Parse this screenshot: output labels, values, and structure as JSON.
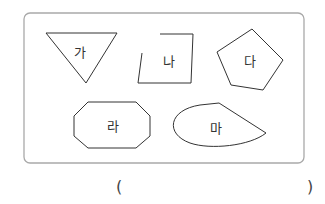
{
  "figure": {
    "border_color": "#a9a9a9",
    "stroke_color": "#333333",
    "shapes": [
      {
        "id": "ga",
        "label": "가",
        "type": "inverted-triangle"
      },
      {
        "id": "na",
        "label": "나",
        "type": "open-quadrilateral"
      },
      {
        "id": "da",
        "label": "다",
        "type": "pentagon"
      },
      {
        "id": "ra",
        "label": "라",
        "type": "octagon"
      },
      {
        "id": "ma",
        "label": "마",
        "type": "teardrop"
      }
    ]
  },
  "answer": {
    "open_paren": "(",
    "close_paren": ")",
    "value": ""
  }
}
